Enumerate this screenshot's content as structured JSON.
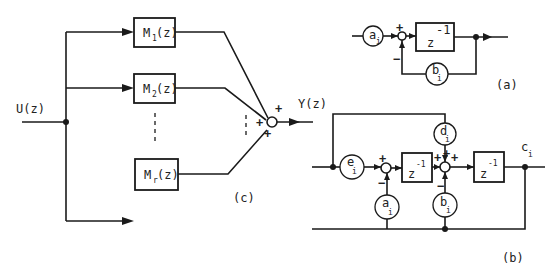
{
  "figure_c": {
    "input_label": "U(z)",
    "output_label": "Y(z)",
    "blocks": [
      {
        "name": "M",
        "sub": "1",
        "arg": "(z)"
      },
      {
        "name": "M",
        "sub": "2",
        "arg": "(z)"
      },
      {
        "name": "M",
        "sub": "r",
        "arg": "(z)"
      }
    ],
    "summer_signs": [
      "+",
      "+",
      "+"
    ],
    "caption": "(c)"
  },
  "figure_a": {
    "gain_in": {
      "name": "a",
      "sub": "i"
    },
    "delay": {
      "base": "z",
      "exp": "-1"
    },
    "gain_fb": {
      "name": "b",
      "sub": "i"
    },
    "summer_signs": [
      "+",
      "−"
    ],
    "caption": "(a)"
  },
  "figure_b": {
    "gain_e": {
      "name": "e",
      "sub": "i"
    },
    "gain_a": {
      "name": "a",
      "sub": "i"
    },
    "gain_b": {
      "name": "b",
      "sub": "i"
    },
    "gain_d": {
      "name": "d",
      "sub": "i"
    },
    "delay1": {
      "base": "z",
      "exp": "-1"
    },
    "delay2": {
      "base": "z",
      "exp": "-1"
    },
    "output_label": {
      "name": "c",
      "sub": "i"
    },
    "summer1_signs": [
      "+",
      "−"
    ],
    "summer2_signs": [
      "+",
      "+",
      "+",
      "−"
    ],
    "caption": "(b)"
  }
}
